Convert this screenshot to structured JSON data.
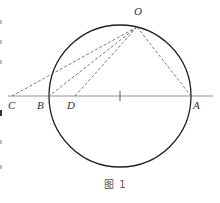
{
  "figure": {
    "caption": "图 1",
    "points": {
      "O": {
        "label": "O",
        "x": 137,
        "y": 27
      },
      "C": {
        "label": "C",
        "x": 12,
        "y": 96
      },
      "B": {
        "label": "B",
        "x": 49,
        "y": 96
      },
      "D": {
        "label": "D",
        "x": 75,
        "y": 96
      },
      "A": {
        "label": "A",
        "x": 191,
        "y": 96
      }
    },
    "circle": {
      "cx": 120,
      "cy": 96,
      "r": 71
    },
    "baseline": {
      "x1": 8,
      "x2": 213,
      "y": 96
    },
    "center_tick": {
      "x": 120,
      "y": 96
    },
    "dashed_segments": [
      "OC",
      "OB",
      "OD",
      "OA"
    ],
    "colors": {
      "stroke": "#222222",
      "dashed": "#555555",
      "label": "#333333"
    }
  }
}
